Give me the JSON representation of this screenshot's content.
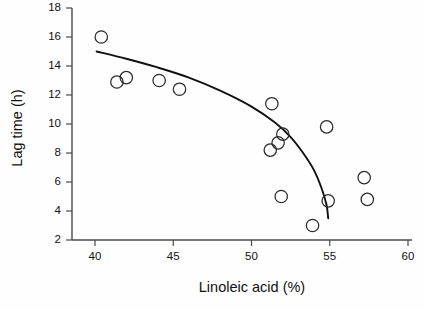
{
  "chart_data": {
    "type": "scatter",
    "title": "",
    "xlabel": "Linoleic acid (%)",
    "ylabel": "Lag time (h)",
    "xlim": [
      38.5,
      60.8
    ],
    "ylim": [
      2,
      18
    ],
    "xticks": [
      40,
      45,
      50,
      55,
      60
    ],
    "yticks": [
      2,
      4,
      6,
      8,
      10,
      12,
      14,
      16,
      18
    ],
    "grid": false,
    "legend": null,
    "marker": "open-circle",
    "points": [
      {
        "x": 40.4,
        "y": 16.0
      },
      {
        "x": 41.4,
        "y": 12.9
      },
      {
        "x": 42.0,
        "y": 13.2
      },
      {
        "x": 44.1,
        "y": 13.0
      },
      {
        "x": 45.4,
        "y": 12.4
      },
      {
        "x": 51.3,
        "y": 11.4
      },
      {
        "x": 51.2,
        "y": 8.2
      },
      {
        "x": 51.7,
        "y": 8.7
      },
      {
        "x": 52.0,
        "y": 9.3
      },
      {
        "x": 51.9,
        "y": 5.0
      },
      {
        "x": 53.9,
        "y": 3.0
      },
      {
        "x": 54.8,
        "y": 9.8
      },
      {
        "x": 54.9,
        "y": 4.7
      },
      {
        "x": 57.2,
        "y": 6.3
      },
      {
        "x": 57.4,
        "y": 4.8
      }
    ],
    "fit_curve": {
      "label": "fitted-trend",
      "start": {
        "x": 40.1,
        "y": 15.0
      },
      "end": {
        "x": 54.9,
        "y": 3.5
      },
      "points": [
        {
          "x": 40.1,
          "y": 15.0
        },
        {
          "x": 42.0,
          "y": 14.5
        },
        {
          "x": 44.0,
          "y": 13.9
        },
        {
          "x": 46.0,
          "y": 13.2
        },
        {
          "x": 48.0,
          "y": 12.3
        },
        {
          "x": 50.0,
          "y": 11.2
        },
        {
          "x": 51.5,
          "y": 10.1
        },
        {
          "x": 52.5,
          "y": 9.1
        },
        {
          "x": 53.3,
          "y": 8.0
        },
        {
          "x": 54.0,
          "y": 6.8
        },
        {
          "x": 54.5,
          "y": 5.5
        },
        {
          "x": 54.8,
          "y": 4.4
        },
        {
          "x": 54.9,
          "y": 3.5
        }
      ]
    }
  },
  "axes": {
    "x_title": "Linoleic acid (%)",
    "y_title": "Lag time (h)",
    "x_tick_labels": [
      "40",
      "45",
      "50",
      "55",
      "60"
    ],
    "y_tick_labels": [
      "2",
      "4",
      "6",
      "8",
      "10",
      "12",
      "14",
      "16",
      "18"
    ]
  },
  "colors": {
    "marker_stroke": "#2b2b2b",
    "curve": "#111111",
    "axis": "#4a4a4a",
    "background": "#fefefe"
  }
}
